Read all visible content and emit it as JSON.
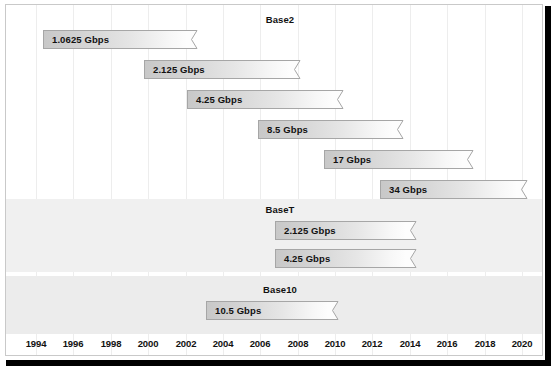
{
  "figure": {
    "background_color": "#ffffff",
    "panel_border_color": "#c9c9c9",
    "shadow_color": "#000000",
    "band_color": "#f0f0f0",
    "gridline_color": "#ededed",
    "bar_fill_start": "#c8c8c8",
    "bar_fill_end": "#fdfdfd",
    "bar_border_color": "#a6a6a6",
    "text_color": "#111111"
  },
  "axis": {
    "name": "year-axis",
    "min": 1994,
    "max": 2020,
    "step": 2,
    "ticks": [
      "1994",
      "1996",
      "1998",
      "2000",
      "2002",
      "2004",
      "2006",
      "2008",
      "2010",
      "2012",
      "2014",
      "2016",
      "2018",
      "2020"
    ]
  },
  "sections": [
    {
      "id": "base2",
      "title": "Base2",
      "banded": false,
      "bars": [
        {
          "label": "1.0625 Gbps",
          "start": 1994.4,
          "end": 2002.7
        },
        {
          "label": "2.125 Gbps",
          "start": 1999.8,
          "end": 2008.2
        },
        {
          "label": "4.25 Gbps",
          "start": 2002.1,
          "end": 2010.5
        },
        {
          "label": "8.5 Gbps",
          "start": 2005.9,
          "end": 2013.7
        },
        {
          "label": "17 Gbps",
          "start": 2009.4,
          "end": 2017.4
        },
        {
          "label": "34 Gbps",
          "start": 2012.4,
          "end": 2020.3
        }
      ]
    },
    {
      "id": "baset",
      "title": "BaseT",
      "banded": true,
      "bars": [
        {
          "label": "2.125 Gbps",
          "start": 2006.8,
          "end": 2014.4
        },
        {
          "label": "4.25 Gbps",
          "start": 2006.8,
          "end": 2014.4
        }
      ]
    },
    {
      "id": "base10",
      "title": "Base10",
      "banded": true,
      "bars": [
        {
          "label": "10.5 Gbps",
          "start": 2003.1,
          "end": 2010.2
        }
      ]
    }
  ],
  "chart_data": {
    "type": "bar",
    "xlabel": "Year",
    "ylabel": "",
    "xlim": [
      1994,
      2020
    ],
    "grid": true,
    "legend": "none",
    "orientation": "horizontal-timeline",
    "groups": [
      {
        "name": "Base2",
        "bars": [
          {
            "category": "1.0625 Gbps",
            "value": 1.0625,
            "unit": "Gbps",
            "start_year": 1994.4,
            "end_year": 2002.7
          },
          {
            "category": "2.125 Gbps",
            "value": 2.125,
            "unit": "Gbps",
            "start_year": 1999.8,
            "end_year": 2008.2
          },
          {
            "category": "4.25 Gbps",
            "value": 4.25,
            "unit": "Gbps",
            "start_year": 2002.1,
            "end_year": 2010.5
          },
          {
            "category": "8.5 Gbps",
            "value": 8.5,
            "unit": "Gbps",
            "start_year": 2005.9,
            "end_year": 2013.7
          },
          {
            "category": "17 Gbps",
            "value": 17,
            "unit": "Gbps",
            "start_year": 2009.4,
            "end_year": 2017.4
          },
          {
            "category": "34 Gbps",
            "value": 34,
            "unit": "Gbps",
            "start_year": 2012.4,
            "end_year": 2020.3
          }
        ]
      },
      {
        "name": "BaseT",
        "bars": [
          {
            "category": "2.125 Gbps",
            "value": 2.125,
            "unit": "Gbps",
            "start_year": 2006.8,
            "end_year": 2014.4
          },
          {
            "category": "4.25 Gbps",
            "value": 4.25,
            "unit": "Gbps",
            "start_year": 2006.8,
            "end_year": 2014.4
          }
        ]
      },
      {
        "name": "Base10",
        "bars": [
          {
            "category": "10.5 Gbps",
            "value": 10.5,
            "unit": "Gbps",
            "start_year": 2003.1,
            "end_year": 2010.2
          }
        ]
      }
    ]
  }
}
